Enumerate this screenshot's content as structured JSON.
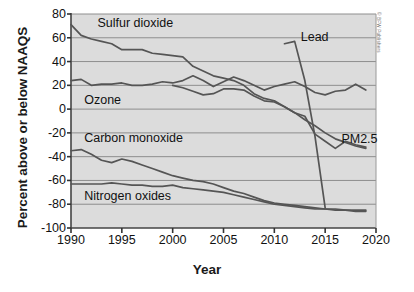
{
  "figure": {
    "credit": "© BFW Publishers"
  },
  "chart_data": {
    "type": "line",
    "title": "",
    "xlabel": "Year",
    "ylabel": "Percent above or below NAAQS",
    "xlim": [
      1990,
      2020
    ],
    "ylim": [
      -100,
      80
    ],
    "xticks": [
      1990,
      1995,
      2000,
      2005,
      2010,
      2015,
      2020
    ],
    "yticks": [
      80,
      60,
      40,
      20,
      0,
      -20,
      -40,
      -60,
      -80,
      -100
    ],
    "grid": "horizontal",
    "legend_position": "inline-annotations",
    "plot_background": "#dcdcdc",
    "line_color": "#555555",
    "series": [
      {
        "name": "Sulfur dioxide",
        "label_x": 1992.6,
        "label_y": 72,
        "x": [
          1990,
          1991,
          1992,
          1993,
          1994,
          1995,
          1996,
          1997,
          1998,
          1999,
          2000,
          2001,
          2002,
          2003,
          2004,
          2005,
          2006,
          2007,
          2008,
          2009,
          2010,
          2011,
          2012,
          2013,
          2014,
          2015,
          2016,
          2017,
          2018,
          2019
        ],
        "values": [
          71,
          62,
          59,
          57,
          55,
          50,
          50,
          50,
          47,
          46,
          45,
          44,
          36,
          32,
          28,
          26,
          24,
          20,
          13,
          9,
          7,
          2,
          -3,
          -9,
          -14,
          -20,
          -25,
          -28,
          -31,
          -33
        ]
      },
      {
        "name": "Ozone",
        "label_x": 1991.3,
        "label_y": 7,
        "x": [
          1990,
          1991,
          1992,
          1993,
          1994,
          1995,
          1996,
          1997,
          1998,
          1999,
          2000,
          2001,
          2002,
          2003,
          2004,
          2005,
          2006,
          2007,
          2008,
          2009,
          2010,
          2011,
          2012,
          2013,
          2014,
          2015,
          2016,
          2017,
          2018,
          2019
        ],
        "values": [
          24,
          25,
          20,
          21,
          21,
          22,
          20,
          20,
          21,
          23,
          22,
          24,
          28,
          24,
          19,
          23,
          27,
          24,
          20,
          16,
          19,
          21,
          23,
          19,
          14,
          12,
          15,
          16,
          21,
          16
        ]
      },
      {
        "name": "Lead",
        "label_x": 2012.6,
        "label_y": 60,
        "x": [
          2011,
          2012,
          2013,
          2014,
          2015
        ],
        "values": [
          55,
          57,
          24,
          -23,
          -83
        ]
      },
      {
        "name": "PM2.5",
        "label_x": 2016.6,
        "label_y": -26,
        "x": [
          2000,
          2001,
          2002,
          2003,
          2004,
          2005,
          2006,
          2007,
          2008,
          2009,
          2010,
          2011,
          2012,
          2013,
          2014,
          2015,
          2016,
          2017,
          2018,
          2019
        ],
        "values": [
          20,
          18,
          15,
          12,
          13,
          17,
          17,
          16,
          11,
          7,
          6,
          2,
          -3,
          -6,
          -21,
          -27,
          -33,
          -27,
          -30,
          -32
        ]
      },
      {
        "name": "Carbon monoxide",
        "label_x": 1991.3,
        "label_y": -25,
        "x": [
          1990,
          1991,
          1992,
          1993,
          1994,
          1995,
          1996,
          1997,
          1998,
          1999,
          2000,
          2001,
          2002,
          2003,
          2004,
          2005,
          2006,
          2007,
          2008,
          2009,
          2010,
          2011,
          2012,
          2013,
          2014,
          2015,
          2016,
          2017,
          2018,
          2019
        ],
        "values": [
          -35,
          -34,
          -38,
          -43,
          -45,
          -42,
          -44,
          -47,
          -50,
          -53,
          -56,
          -58,
          -60,
          -61,
          -63,
          -66,
          -69,
          -71,
          -74,
          -77,
          -79,
          -80,
          -81,
          -82,
          -83,
          -84,
          -84,
          -85,
          -85,
          -85
        ]
      },
      {
        "name": "Nitrogen oxides",
        "label_x": 1991.3,
        "label_y": -74,
        "x": [
          1990,
          1991,
          1992,
          1993,
          1994,
          1995,
          1996,
          1997,
          1998,
          1999,
          2000,
          2001,
          2002,
          2003,
          2004,
          2005,
          2006,
          2007,
          2008,
          2009,
          2010,
          2011,
          2012,
          2013,
          2014,
          2015,
          2016,
          2017,
          2018,
          2019
        ],
        "values": [
          -63,
          -63,
          -63,
          -63,
          -62,
          -63,
          -64,
          -64,
          -65,
          -65,
          -64,
          -66,
          -67,
          -68,
          -69,
          -70,
          -72,
          -74,
          -76,
          -78,
          -80,
          -81,
          -82,
          -83,
          -84,
          -84,
          -85,
          -85,
          -86,
          -86
        ]
      }
    ]
  }
}
